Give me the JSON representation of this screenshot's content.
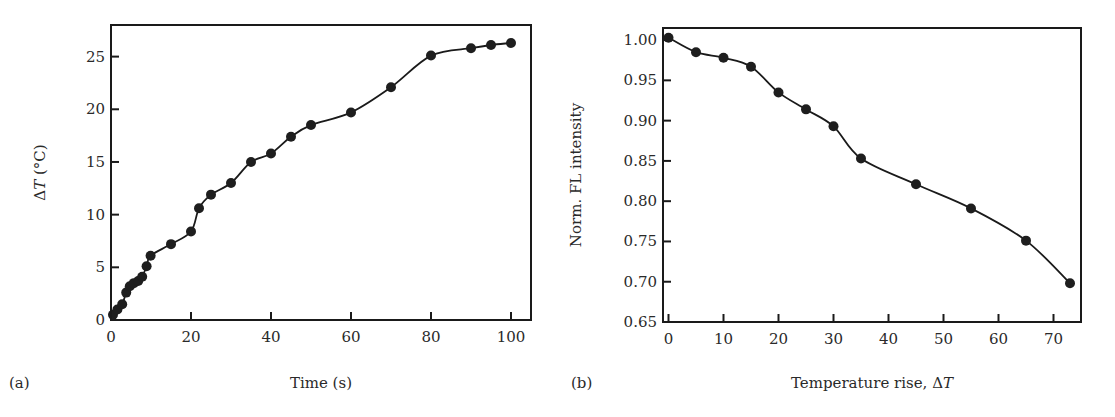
{
  "chart_data": [
    {
      "panel_label": "(a)",
      "type": "line",
      "title": "",
      "xlabel": "Time (s)",
      "ylabel_prefix": "Δ",
      "ylabel_var": "T",
      "ylabel_suffix": " (°C)",
      "ylabel": "ΔT (°C)",
      "xlim": [
        0,
        105
      ],
      "ylim": [
        0,
        28
      ],
      "xticks": [
        0,
        20,
        40,
        60,
        80,
        100
      ],
      "yticks": [
        0,
        5,
        10,
        15,
        20,
        25
      ],
      "grid": false,
      "legend": null,
      "markers": "filled-circle",
      "series": [
        {
          "name": "ΔT vs time",
          "x": [
            0.5,
            1.6,
            2.8,
            3.8,
            4.7,
            5.7,
            6.8,
            7.8,
            8.9,
            9.9,
            15,
            20,
            22,
            25,
            30,
            35,
            40,
            45,
            50,
            60,
            70,
            80,
            90,
            95,
            100
          ],
          "y": [
            0.5,
            1.0,
            1.5,
            2.6,
            3.2,
            3.5,
            3.7,
            4.1,
            5.1,
            6.1,
            7.2,
            8.4,
            10.6,
            11.9,
            13.0,
            15.0,
            15.8,
            17.4,
            18.5,
            19.7,
            22.1,
            25.1,
            25.8,
            26.1,
            26.3
          ]
        }
      ]
    },
    {
      "panel_label": "(b)",
      "type": "line",
      "title": "",
      "xlabel_prefix": "Temperature rise, Δ",
      "xlabel_var": "T",
      "xlabel": "Temperature rise, ΔT",
      "ylabel": "Norm. FL intensity",
      "xlim": [
        -1,
        75
      ],
      "ylim": [
        0.65,
        1.015
      ],
      "xticks": [
        0,
        10,
        20,
        30,
        40,
        50,
        60,
        70
      ],
      "yticks": [
        0.65,
        0.7,
        0.75,
        0.8,
        0.85,
        0.9,
        0.95,
        1.0
      ],
      "ytick_labels": [
        "0.65",
        "0.70",
        "0.75",
        "0.80",
        "0.85",
        "0.90",
        "0.95",
        "1.00"
      ],
      "grid": false,
      "legend": null,
      "markers": "filled-circle",
      "series": [
        {
          "name": "Normalized FL intensity",
          "x": [
            0,
            5,
            10,
            15,
            20,
            25,
            30,
            35,
            45,
            55,
            65,
            73
          ],
          "y": [
            1.003,
            0.985,
            0.978,
            0.967,
            0.935,
            0.914,
            0.893,
            0.853,
            0.821,
            0.791,
            0.751,
            0.698
          ]
        }
      ]
    }
  ],
  "layout": {
    "panels": [
      {
        "frame": {
          "left": 111,
          "top": 25,
          "right": 531,
          "bottom": 320
        },
        "x0px": 113,
        "x1px": 512,
        "y0px": 320,
        "y1px": 25
      },
      {
        "frame": {
          "left": 663,
          "top": 28,
          "right": 1081,
          "bottom": 322
        },
        "x0px": 663,
        "x1px": 1081,
        "y0px": 322,
        "y1px": 28
      }
    ]
  },
  "colors": {
    "ink": "#1a1a1a",
    "background": "#ffffff"
  }
}
